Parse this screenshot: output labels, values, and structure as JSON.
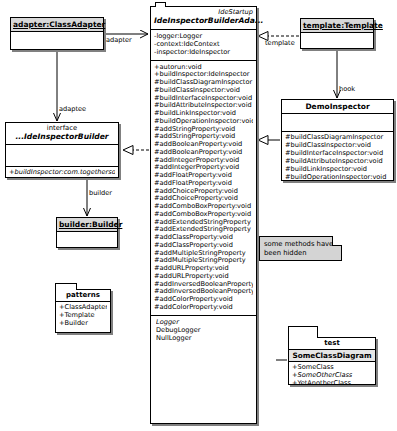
{
  "diagram": {
    "background": "#ffffff",
    "line_color": "#000000",
    "shadow_color": "#808080",
    "header_fill": "#d8d8d8",
    "note_fill": "#d4d4d4"
  },
  "adapter_class": {
    "name": "adapter:ClassAdapter"
  },
  "interface_class": {
    "stereotype": "interface",
    "name": "...IdeInspectorBuilder",
    "operations": [
      "+buildInspector:com.togetherso"
    ]
  },
  "builder_class": {
    "name": "builder:Builder"
  },
  "patterns_package": {
    "name": "patterns",
    "items": [
      "+ClassAdapter",
      "+Template",
      "+Builder"
    ]
  },
  "main_class": {
    "package": "IdeStartup",
    "name": "IdeInspectorBuilderAda...",
    "attributes": [
      "-logger:Logger",
      "-context:IdeContext",
      "-inspector:IdeInspector"
    ],
    "operations": [
      "+autorun:void",
      "+buildInspector:IdeInspector",
      "#buildClassDiagramInspector",
      "#buildClassInspector:void",
      "#buildInterfaceInspector:void",
      "#buildAttributeInspector:void",
      "#buildLinkInspector:void",
      "#buildOperationInspector:void",
      "#addStringProperty:void",
      "#addStringProperty:void",
      "#addBooleanProperty:void",
      "#addBooleanProperty:void",
      "#addIntegerProperty:void",
      "#addIntegerProperty:void",
      "#addFloatProperty:void",
      "#addFloatProperty:void",
      "#addChoiceProperty:void",
      "#addChoiceProperty:void",
      "#addComboBoxProperty:void",
      "#addComboBoxProperty:void",
      "#addExtendedStringProperty",
      "#addExtendedStringProperty",
      "#addClassProperty:void",
      "#addClassProperty:void",
      "#addMultipleStringProperty",
      "#addMultipleStringProperty",
      "#addURLProperty:void",
      "#addURLProperty:void",
      "#addInversedBooleanProperty",
      "#addInversedBooleanProperty",
      "#addColorProperty:void",
      "#addColorProperty:void"
    ],
    "nested": [
      "Logger",
      "DebugLogger",
      "NullLogger"
    ]
  },
  "template_class": {
    "name": "template:Template"
  },
  "demo_class": {
    "name": "DemoInspector",
    "operations": [
      "#buildClassDiagramInspector",
      "#buildClassInspector:void",
      "#buildInterfaceInspector:void",
      "#buildAttributeInspector:void",
      "#buildLinkInspector:void",
      "#buildOperationInspector:void"
    ]
  },
  "test_package": {
    "name": "test",
    "class_name": "SomeClassDiagram",
    "items": [
      "+SomeClass",
      "+SomeOtherClass",
      "+YetAnotherClass"
    ]
  },
  "note": {
    "text": "some methods have been hidden"
  },
  "edge_labels": {
    "adapter": "adapter",
    "adaptee": "adaptee",
    "builder": "builder",
    "template": "template",
    "hook": "hook"
  }
}
